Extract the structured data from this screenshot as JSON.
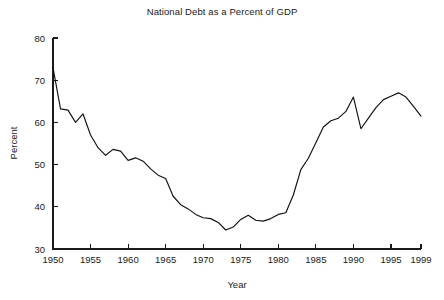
{
  "chart_data": {
    "type": "line",
    "title": "National Debt as a Percent of GDP",
    "xlabel": "Year",
    "ylabel": "Percent",
    "xlim": [
      1950,
      1999
    ],
    "ylim": [
      30,
      80
    ],
    "grid": false,
    "legend": false,
    "line_color": "#111111",
    "background_color": "#ffffff",
    "xticks": [
      1950,
      1955,
      1960,
      1965,
      1970,
      1975,
      1980,
      1985,
      1990,
      1995,
      1999
    ],
    "xtick_labels": [
      "1950",
      "1955",
      "1960",
      "1965",
      "1970",
      "1975",
      "1980",
      "1985",
      "1990",
      "1995",
      "1999"
    ],
    "yticks": [
      30,
      40,
      50,
      60,
      70,
      80
    ],
    "ytick_labels": [
      "30",
      "40",
      "50",
      "60",
      "70",
      "80"
    ],
    "series": [
      {
        "name": "National Debt as a Percent of GDP",
        "x": [
          1950,
          1951,
          1952,
          1953,
          1954,
          1955,
          1956,
          1957,
          1958,
          1959,
          1960,
          1961,
          1962,
          1963,
          1964,
          1965,
          1966,
          1967,
          1968,
          1969,
          1970,
          1971,
          1972,
          1973,
          1974,
          1975,
          1976,
          1977,
          1978,
          1979,
          1980,
          1981,
          1982,
          1983,
          1984,
          1985,
          1986,
          1987,
          1988,
          1989,
          1990,
          1991,
          1992,
          1993,
          1994,
          1995,
          1996,
          1997,
          1998,
          1999
        ],
        "values": [
          73.0,
          63.2,
          62.9,
          60.0,
          62.0,
          57.0,
          54.0,
          52.2,
          53.6,
          53.2,
          51.0,
          51.6,
          50.8,
          49.0,
          47.5,
          46.7,
          42.5,
          40.5,
          39.5,
          38.2,
          37.4,
          37.2,
          36.3,
          34.5,
          35.2,
          37.0,
          38.0,
          36.8,
          36.6,
          37.2,
          38.2,
          38.6,
          42.8,
          48.8,
          51.5,
          55.2,
          58.9,
          60.4,
          61.0,
          62.6,
          66.0,
          58.5,
          61.0,
          63.5,
          65.4,
          66.2,
          67.0,
          66.0,
          63.8,
          61.5
        ]
      }
    ]
  },
  "axes_geometry": {
    "plot_left": 53,
    "plot_right": 421,
    "plot_top": 38,
    "plot_bottom": 249
  }
}
